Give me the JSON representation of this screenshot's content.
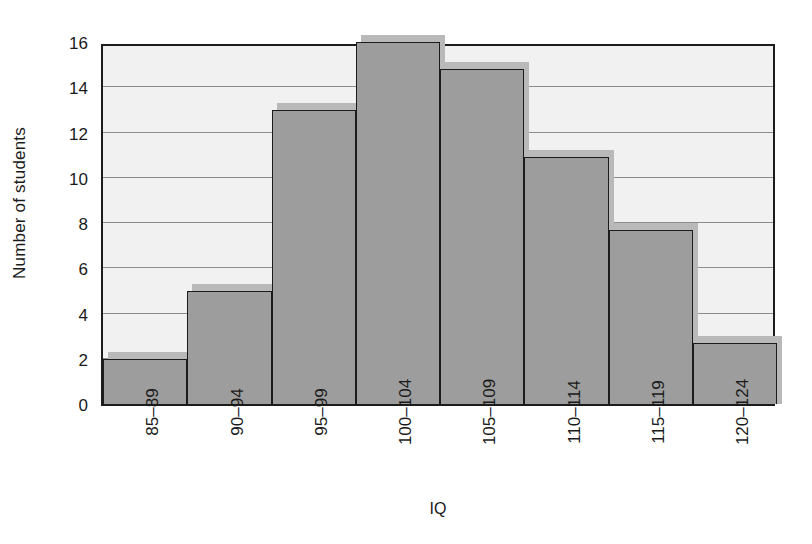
{
  "chart_data": {
    "type": "bar",
    "title": "",
    "subtitle": "",
    "xlabel": "IQ",
    "ylabel": "Number of students",
    "categories": [
      "85–89",
      "90–94",
      "95–99",
      "100–104",
      "105–109",
      "110–114",
      "115–119",
      "120–124"
    ],
    "values": [
      2,
      5,
      13,
      16,
      14.8,
      10.9,
      7.7,
      2.7
    ],
    "ylim": [
      0,
      16
    ],
    "yticks": [
      0,
      2,
      4,
      6,
      8,
      10,
      12,
      14,
      16
    ],
    "ytick_labels": [
      "0",
      "2",
      "4",
      "6",
      "8",
      "10",
      "12",
      "14",
      "16"
    ],
    "gridlines": [
      2,
      4,
      6,
      8,
      10,
      12,
      14
    ],
    "grid": true,
    "legend": false,
    "legend_position": "none",
    "xtick_rotation": -90,
    "colors": {
      "bar_fill": "#9d9d9d",
      "bar_edge": "#1c1c1c",
      "bar_shadow": "#b9b9b9",
      "plot_background": "#f1f1f1",
      "gridline": "#8d8d8d",
      "axis": "#1c1c1c",
      "text": "#1a1a1a",
      "figure_background": "#ffffff"
    }
  }
}
